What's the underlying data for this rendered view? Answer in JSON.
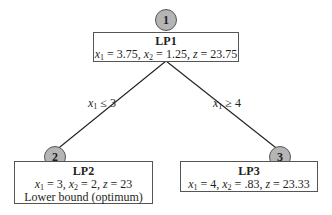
{
  "diagram": {
    "type": "branch-and-bound-tree",
    "nodes": [
      {
        "id": "1",
        "title": "LP1",
        "x1": "3.75",
        "x2": "1.25",
        "z": "23.75",
        "note": ""
      },
      {
        "id": "2",
        "title": "LP2",
        "x1": "3",
        "x2": "2",
        "z": "23",
        "note": "Lower bound (optimum)"
      },
      {
        "id": "3",
        "title": "LP3",
        "x1": "4",
        "x2": ".83",
        "z": "23.33",
        "note": ""
      }
    ],
    "edges": [
      {
        "from": "1",
        "to": "2",
        "var": "x",
        "sub": "1",
        "op": "≤",
        "value": "3"
      },
      {
        "from": "1",
        "to": "3",
        "var": "x",
        "sub": "1",
        "op": "≥",
        "value": "4"
      }
    ]
  },
  "labels": {
    "x": "x",
    "z": "z",
    "sub1": "1",
    "sub2": "2",
    "eq": " = ",
    "comma": ", "
  },
  "colors": {
    "circle_fill": "#b5b5b5",
    "line": "#231f20",
    "border": "#555555"
  }
}
